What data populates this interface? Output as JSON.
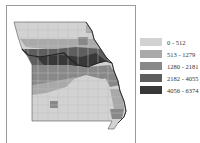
{
  "map": {
    "region": "Missouri counties",
    "type": "choropleth",
    "river_outline_color": "#222222",
    "county_border_color": "#bdbdbd"
  },
  "legend": {
    "items": [
      {
        "label": "0 - 512",
        "color": "#d2d2d2"
      },
      {
        "label": "513 - 1279",
        "color": "#a9a9a9"
      },
      {
        "label": "1280 - 2181",
        "color": "#888888"
      },
      {
        "label": "2182 - 4055",
        "color": "#5e5e5e"
      },
      {
        "label": "4056 - 6374",
        "color": "#383838"
      }
    ]
  }
}
